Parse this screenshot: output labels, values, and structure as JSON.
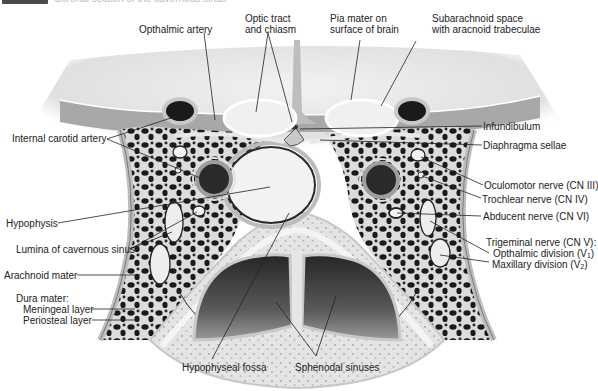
{
  "header": {
    "caption": "Coronal section of the cavernous sinus"
  },
  "colors": {
    "background": "#ffffff",
    "tissue_light": "#d9d9d9",
    "tissue_mid": "#a8a8a8",
    "tissue_dark": "#1e1e1e",
    "bone": "#e6e6e6",
    "sinus_air": "#3a3a3a",
    "leader_line": "#222222",
    "label_text": "#222222"
  },
  "labels": {
    "top": {
      "opthalmic_artery": "Opthalmic artery",
      "optic_tract_1": "Optic tract",
      "optic_tract_2": "and chiasm",
      "pia_mater_1": "Pia mater on",
      "pia_mater_2": "surface of brain",
      "subarachnoid_1": "Subarachnoid space",
      "subarachnoid_2": "with aracnoid trabeculae"
    },
    "left": {
      "internal_carotid": "Internal carotid artery",
      "hypophysis": "Hypophysis",
      "lumina_cavernous": "Lumina of cavernous sinus",
      "arachnoid": "Arachnoid mater",
      "dura_mater": "Dura mater:",
      "meningeal": "Meningeal layer",
      "periosteal": "Periosteal layer"
    },
    "right": {
      "infundibulum": "Infundibulum",
      "diaphragma": "Diaphragma sellae",
      "oculomotor": "Oculomotor nerve (CN III)",
      "trochlear": "Trochlear nerve (CN IV)",
      "abducent": "Abducent nerve (CN VI)",
      "trigeminal": "Trigeminal nerve (CN V):",
      "opthalmic_div": "Opthalmic division (V",
      "opthalmic_sub": "1",
      "maxillary_div": "Maxillary division (V",
      "maxillary_sub": "2",
      "close_paren": ")"
    },
    "bottom": {
      "hypophyseal_fossa": "Hypophyseal fossa",
      "sphenodal_sinuses": "Sphenodal sinuses"
    }
  }
}
